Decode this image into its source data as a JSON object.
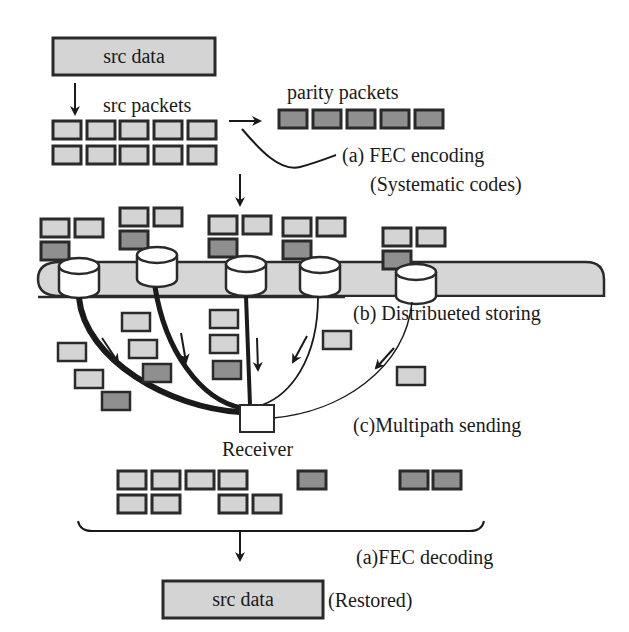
{
  "diagram": {
    "colors": {
      "src_packet_fill": "#d4d4d4",
      "parity_packet_fill": "#8f8f8f",
      "storage_band_fill": "#d6d6d6",
      "outline": "#2a2a2a",
      "background": "#ffffff"
    },
    "labels": {
      "src_data_top": "src data",
      "src_packets": "src packets",
      "parity_packets": "parity packets",
      "fec_encoding": "(a) FEC encoding",
      "systematic_codes": "(Systematic codes)",
      "distributed_storing": "(b) Distribueted storing",
      "multipath_sending": "(c)Multipath sending",
      "receiver": "Receiver",
      "fec_decoding": "(a)FEC decoding",
      "src_data_bottom": "src data",
      "restored": "(Restored)"
    },
    "stages": [
      {
        "id": "a",
        "name": "FEC encoding",
        "note": "Systematic codes"
      },
      {
        "id": "b",
        "name": "Distribueted storing"
      },
      {
        "id": "c",
        "name": "Multipath sending"
      },
      {
        "id": "a",
        "name": "FEC decoding",
        "note": "Restored"
      }
    ],
    "counts": {
      "src_packets": 10,
      "parity_packets": 5,
      "storage_nodes": 5,
      "received_src_packets": 8,
      "received_parity_packets": 3
    }
  }
}
